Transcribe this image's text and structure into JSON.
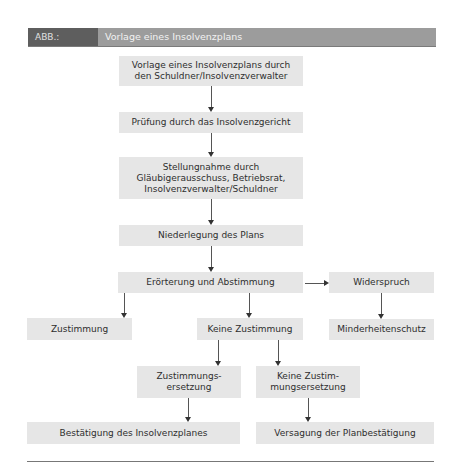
{
  "header": {
    "label": "ABB.:",
    "title": "Vorlage eines Insolvenzplans"
  },
  "nodes": {
    "vorlage": "Vorlage eines Insolvenzplans durch\nden Schuldner/Insolvenzverwalter",
    "pruefung": "Prüfung durch das Insolvenzgericht",
    "stellungnahme": "Stellungnahme durch\nGläubigerausschuss, Betriebsrat,\nInsolvenzverwalter/Schuldner",
    "niederlegung": "Niederlegung des Plans",
    "eroerterung": "Erörterung und Abstimmung",
    "widerspruch": "Widerspruch",
    "zustimmung": "Zustimmung",
    "keine_zustimmung": "Keine Zustimmung",
    "minderheitenschutz": "Minderheitenschutz",
    "zustimmungsersetzung": "Zustimmungs-\nersetzung",
    "keine_zustimmungsersetzung": "Keine Zustim-\nmungsersetzung",
    "bestaetigung": "Bestätigung des Insolvenzplanes",
    "versagung": "Versagung der Planbestätigung"
  },
  "colors": {
    "header_label_bg": "#5e5e5e",
    "header_title_bg": "#9c9c9c",
    "box_fill": "#e6e6e6",
    "text": "#2e2e2e",
    "connector": "#555555"
  }
}
